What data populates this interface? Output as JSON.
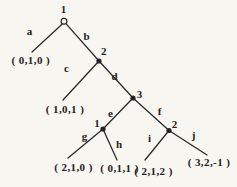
{
  "colors": {
    "paper": "#f7f6f1",
    "ink": "#2b2b2b"
  },
  "tree": {
    "type": "game-tree",
    "nodes": [
      {
        "id": "root",
        "label": "1",
        "marker": "open-circle"
      },
      {
        "id": "n2",
        "label": "2",
        "marker": "filled-dot"
      },
      {
        "id": "n3",
        "label": "3",
        "marker": "filled-dot"
      },
      {
        "id": "n4",
        "label": "1",
        "marker": "filled-dot"
      },
      {
        "id": "n5",
        "label": "2",
        "marker": "filled-dot"
      }
    ],
    "edges": [
      {
        "label": "a"
      },
      {
        "label": "b"
      },
      {
        "label": "c"
      },
      {
        "label": "d"
      },
      {
        "label": "e"
      },
      {
        "label": "f"
      },
      {
        "label": "g"
      },
      {
        "label": "h"
      },
      {
        "label": "i"
      },
      {
        "label": "j"
      }
    ],
    "leaves": [
      {
        "payoff": "( 0,1,0 )"
      },
      {
        "payoff": "( 1,0,1 )"
      },
      {
        "payoff": "( 2,1,0 )"
      },
      {
        "payoff": "( 0,1,1 )"
      },
      {
        "payoff": "( 2,1,2 )"
      },
      {
        "payoff": "( 3,2,-1 )"
      }
    ]
  }
}
